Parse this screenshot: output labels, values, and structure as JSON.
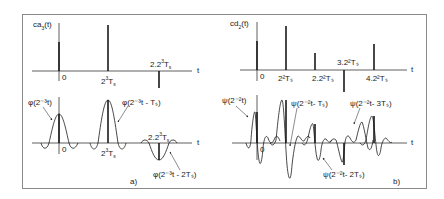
{
  "panel_a": {
    "caption": "a)",
    "top_label_main": "ca",
    "top_label_sub": "3",
    "top_label_tail": "(t)",
    "axis_t": "t",
    "tick_0": "0",
    "tick_1_base": "2",
    "tick_1_exp": "3",
    "tick_1_T": "T",
    "tick_1_sub": "s",
    "tick_2_prefix": "2.2",
    "tick_2_exp": "3",
    "tick_2_T": "T",
    "tick_2_sub": "s",
    "bottom_axis_t": "t",
    "bottom_tick_0": "0",
    "phi0": "φ(2⁻³t)",
    "phi1": "φ(2⁻³t - Tₛ)",
    "phi2": "φ(2⁻³t - 2Tₛ)"
  },
  "panel_b": {
    "caption": "b)",
    "top_label_main": "cd",
    "top_label_sub": "2",
    "top_label_tail": "(t)",
    "axis_t": "t",
    "tick_0": "0",
    "tick_1": "2²Tₛ",
    "tick_2": "2.2²Tₛ",
    "tick_3": "3.2²Tₛ",
    "tick_4": "4.2²Tₛ",
    "bottom_axis_t": "t",
    "bottom_tick_0": "0",
    "psi0": "ψ(2⁻²t)",
    "psi1": "ψ(2⁻²t- Tₛ)",
    "psi2": "ψ(2⁻²t- 2Tₛ)",
    "psi3": "ψ(2⁻²t- 3Tₛ)"
  },
  "colors": {
    "line": "#1a1a1a",
    "frame": "#8a8a8a",
    "background": "#ffffff"
  }
}
